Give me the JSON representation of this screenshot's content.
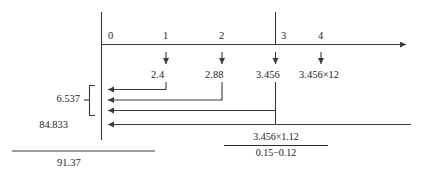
{
  "diagram": {
    "type": "number-line-evaluation-flow",
    "axis": {
      "arrow_direction": "right",
      "tick_labels": [
        "0",
        "1",
        "2",
        "3",
        "4"
      ],
      "tick_x": [
        103,
        166,
        222,
        276,
        321
      ]
    },
    "step_values": [
      {
        "tick": "1",
        "label": "2.4"
      },
      {
        "tick": "2",
        "label": "2.88"
      },
      {
        "tick": "3",
        "label": "3.456"
      },
      {
        "tick": "4",
        "label": "3.456×12"
      }
    ],
    "return_arrows": [
      {
        "from_tick": "1",
        "to": "0"
      },
      {
        "from_tick": "2",
        "to": "0"
      },
      {
        "from_tick": "3",
        "to": "0"
      },
      {
        "from_tick": "far-right",
        "to": "0"
      }
    ],
    "group_label": "6.537",
    "total_label": "84.833",
    "expression": {
      "numerator": "3.456×1.12",
      "denominator": "0.15−0.12"
    },
    "result": "91.37",
    "colors": {
      "line": "#3a3a3a",
      "text": "#1e1e1e",
      "background": "#ffffff"
    }
  }
}
